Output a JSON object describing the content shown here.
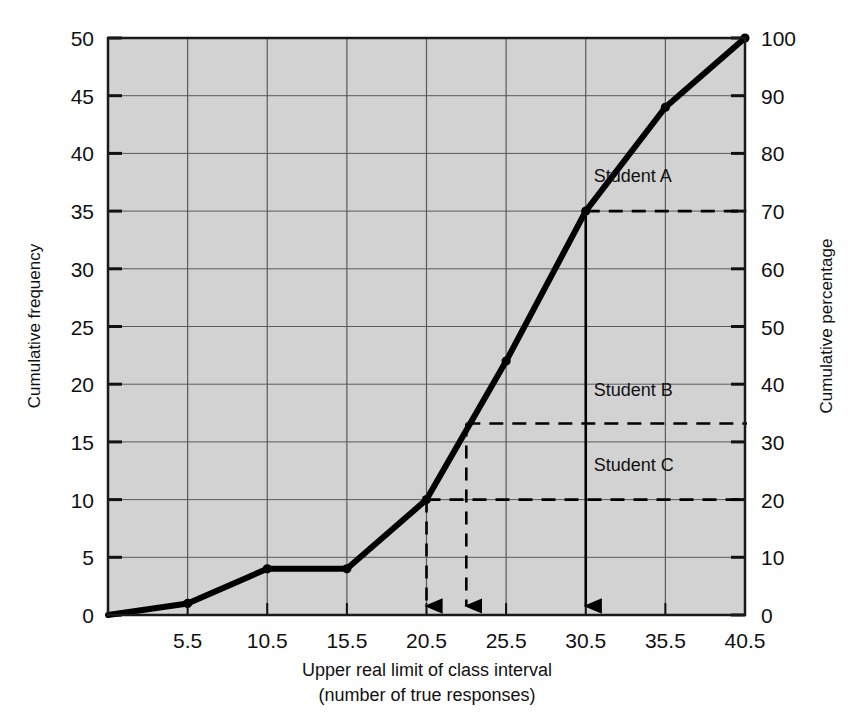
{
  "chart_data": {
    "type": "line",
    "title": "",
    "subtitle": "",
    "xlabel_line1": "Upper real limit of class interval",
    "xlabel_line2": "(number of true responses)",
    "ylabel_left": "Cumulative frequency",
    "ylabel_right": "Cumulative percentage",
    "x": [
      0.5,
      5.5,
      10.5,
      15.5,
      20.5,
      25.5,
      30.5,
      35.5,
      40.5
    ],
    "values": [
      0,
      1,
      4,
      4,
      10,
      22,
      35,
      44,
      50
    ],
    "series": [
      {
        "name": "Cumulative frequency ogive",
        "values": [
          0,
          1,
          4,
          4,
          10,
          22,
          35,
          44,
          50
        ]
      }
    ],
    "percent_values": [
      0,
      2,
      8,
      8,
      20,
      44,
      70,
      88,
      100
    ],
    "xlim": [
      0.5,
      40.5
    ],
    "ylim_left": [
      0,
      50
    ],
    "ylim_right": [
      0,
      100
    ],
    "x_ticks": [
      5.5,
      10.5,
      15.5,
      20.5,
      25.5,
      30.5,
      35.5,
      40.5
    ],
    "x_tick_labels": [
      "5.5",
      "10.5",
      "15.5",
      "20.5",
      "25.5",
      "30.5",
      "35.5",
      "40.5"
    ],
    "y_ticks_left": [
      0,
      5,
      10,
      15,
      20,
      25,
      30,
      35,
      40,
      45,
      50
    ],
    "y_tick_labels_left": [
      "0",
      "5",
      "10",
      "15",
      "20",
      "25",
      "30",
      "35",
      "40",
      "45",
      "50"
    ],
    "y_ticks_right": [
      0,
      10,
      20,
      30,
      40,
      50,
      60,
      70,
      80,
      90,
      100
    ],
    "y_tick_labels_right": [
      "0",
      "10",
      "20",
      "30",
      "40",
      "50",
      "60",
      "70",
      "80",
      "90",
      "100"
    ],
    "grid": true,
    "legend_position": "none",
    "plot_background": "#d2d2d2",
    "line_color": "#000000",
    "annotations": [
      {
        "label": "Student A",
        "y_frequency": 35,
        "y_percent": 70,
        "x_drop": 30.5,
        "label_x": 31.0,
        "label_y": 37.5
      },
      {
        "label": "Student B",
        "y_frequency": 16.6,
        "y_percent": 33,
        "x_drop": 23.0,
        "label_x": 31.0,
        "label_y": 19.0
      },
      {
        "label": "Student C",
        "y_frequency": 10,
        "y_percent": 20,
        "x_drop": 20.5,
        "label_x": 31.0,
        "label_y": 12.5
      }
    ]
  }
}
